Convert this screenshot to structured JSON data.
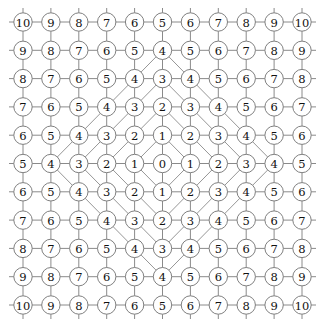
{
  "figure": {
    "name": "manhattan-distance-lattice",
    "type": "lattice-graph-with-contours",
    "width": 321,
    "height": 335,
    "background": "#ffffff"
  },
  "grid": {
    "rows": 11,
    "cols": 11,
    "center_row": 5,
    "center_col": 5,
    "origin_x": 23,
    "origin_y": 22,
    "spacing_x": 27.9,
    "spacing_y": 28.3,
    "node_radius": 9.2,
    "node_fill": "#ffffff",
    "node_stroke": "#808080",
    "node_stroke_width": 1.0,
    "edge_color": "#8a8a8a",
    "edge_width": 1.0,
    "stub_length": 14,
    "label_font_size": 11.5,
    "label_color": "#111111"
  },
  "contours": {
    "levels": [
      1,
      2,
      3,
      4
    ],
    "shape": "diamond",
    "color": "#8a8a8a",
    "width": 0.9
  },
  "chart_data": {
    "type": "heatmap",
    "title": "",
    "xlabel": "",
    "ylabel": "",
    "metric": "manhattan-distance",
    "x": [
      0,
      1,
      2,
      3,
      4,
      5,
      6,
      7,
      8,
      9,
      10
    ],
    "y": [
      0,
      1,
      2,
      3,
      4,
      5,
      6,
      7,
      8,
      9,
      10
    ],
    "values": [
      [
        10,
        9,
        8,
        7,
        6,
        5,
        6,
        7,
        8,
        9,
        10
      ],
      [
        9,
        8,
        7,
        6,
        5,
        4,
        5,
        6,
        7,
        8,
        9
      ],
      [
        8,
        7,
        6,
        5,
        4,
        3,
        4,
        5,
        6,
        7,
        8
      ],
      [
        7,
        6,
        5,
        4,
        3,
        2,
        3,
        4,
        5,
        6,
        7
      ],
      [
        6,
        5,
        4,
        3,
        2,
        1,
        2,
        3,
        4,
        5,
        6
      ],
      [
        5,
        4,
        3,
        2,
        1,
        0,
        1,
        2,
        3,
        4,
        5
      ],
      [
        6,
        5,
        4,
        3,
        2,
        1,
        2,
        3,
        4,
        5,
        6
      ],
      [
        7,
        6,
        5,
        4,
        3,
        2,
        3,
        4,
        5,
        6,
        7
      ],
      [
        8,
        7,
        6,
        5,
        4,
        3,
        4,
        5,
        6,
        7,
        8
      ],
      [
        9,
        8,
        7,
        6,
        5,
        4,
        5,
        6,
        7,
        8,
        9
      ],
      [
        10,
        9,
        8,
        7,
        6,
        5,
        6,
        7,
        8,
        9,
        10
      ]
    ],
    "vmin": 0,
    "vmax": 10,
    "grid": true,
    "legend": "none",
    "contour_levels": [
      1,
      2,
      3,
      4
    ]
  }
}
